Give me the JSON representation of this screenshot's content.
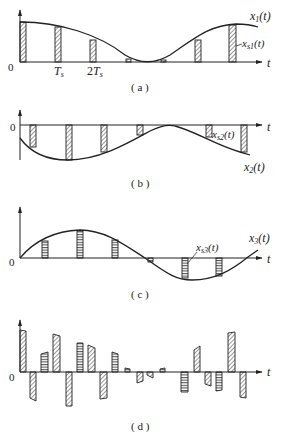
{
  "figure": {
    "panels": [
      {
        "id": "a",
        "caption": "( a )",
        "origin_label": "0",
        "axis_label": "t",
        "curve_label": "x₁(t)",
        "sample_label": "xₛ₁(t)",
        "tick_labels": [
          "Tₛ",
          "2Tₛ"
        ],
        "hatch": "diagonal"
      },
      {
        "id": "b",
        "caption": "( b )",
        "origin_label": "0",
        "axis_label": "t",
        "curve_label": "x₂(t)",
        "sample_label": "xₛ₂(t)",
        "hatch": "diagonal"
      },
      {
        "id": "c",
        "caption": "( c )",
        "origin_label": "0",
        "axis_label": "t",
        "curve_label": "x₃(t)",
        "sample_label": "xₛ₃(t)",
        "hatch": "horizontal"
      },
      {
        "id": "d",
        "caption": "( d )",
        "origin_label": "0",
        "axis_label": "t",
        "hatch": "mixed"
      }
    ],
    "text": {
      "a_caption": "( a )",
      "b_caption": "( b )",
      "c_caption": "( c )",
      "d_caption": "( d )",
      "zero": "0",
      "t": "t",
      "x": "x",
      "ts_T": "T",
      "ts_s": "s",
      "two": "2",
      "sub1": "1",
      "sub2": "2",
      "sub3": "3",
      "subs1": "s1",
      "subs2": "s2",
      "subs3": "s3",
      "paren_t": "(t)"
    }
  }
}
